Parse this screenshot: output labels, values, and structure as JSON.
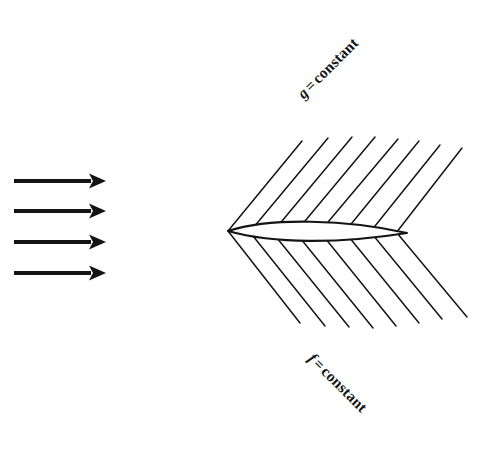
{
  "figure": {
    "type": "flow-field-diagram",
    "background_color": "#ffffff",
    "ink_color": "#141414",
    "width": 489,
    "height": 450
  },
  "labels": {
    "upper": {
      "variable": "g",
      "equals": "=",
      "value": "constant",
      "full_text": "g = constant",
      "rotation_deg": -45,
      "x": 300,
      "y": 88
    },
    "lower": {
      "variable": "f",
      "equals": "=",
      "value": "constant",
      "full_text": "f = constant",
      "rotation_deg": 45,
      "x": 311,
      "y": 348
    }
  },
  "freestream_arrows": {
    "name": "uniform-flow-arrows",
    "count": 4,
    "direction": "right",
    "color": "#141414",
    "shaft_thickness": 4.2,
    "head_length": 17,
    "head_half_width": 7.5,
    "x_start": 14,
    "x_end": 106,
    "y_positions": [
      181,
      211,
      242,
      273
    ]
  },
  "airfoil": {
    "name": "lens-airfoil",
    "leading_edge": {
      "x": 228,
      "y": 231
    },
    "trailing_edge": {
      "x": 407,
      "y": 233
    },
    "max_thickness": 15,
    "stroke_width": 2.1,
    "fill": "#ffffff"
  },
  "streamlines_upper": {
    "name": "g-constant-lines",
    "count": 8,
    "angle_deg": -45,
    "stroke_width": 1.5,
    "lines": [
      {
        "x1": 228,
        "y1": 231,
        "x2": 302,
        "y2": 141
      },
      {
        "x1": 253,
        "y1": 228,
        "x2": 328,
        "y2": 138
      },
      {
        "x1": 277,
        "y1": 227,
        "x2": 352,
        "y2": 137
      },
      {
        "x1": 300,
        "y1": 227,
        "x2": 375,
        "y2": 137
      },
      {
        "x1": 323,
        "y1": 228,
        "x2": 398,
        "y2": 139
      },
      {
        "x1": 347,
        "y1": 229,
        "x2": 419,
        "y2": 141
      },
      {
        "x1": 371,
        "y1": 231,
        "x2": 440,
        "y2": 145
      },
      {
        "x1": 396,
        "y1": 233,
        "x2": 462,
        "y2": 148
      }
    ]
  },
  "streamlines_lower": {
    "name": "f-constant-lines",
    "count": 8,
    "angle_deg": 45,
    "stroke_width": 1.5,
    "lines": [
      {
        "x1": 228,
        "y1": 231,
        "x2": 300,
        "y2": 323
      },
      {
        "x1": 253,
        "y1": 236,
        "x2": 325,
        "y2": 326
      },
      {
        "x1": 277,
        "y1": 238,
        "x2": 349,
        "y2": 327
      },
      {
        "x1": 301,
        "y1": 239,
        "x2": 373,
        "y2": 328
      },
      {
        "x1": 325,
        "y1": 238,
        "x2": 396,
        "y2": 326
      },
      {
        "x1": 349,
        "y1": 237,
        "x2": 419,
        "y2": 323
      },
      {
        "x1": 373,
        "y1": 235,
        "x2": 442,
        "y2": 319
      },
      {
        "x1": 397,
        "y1": 233,
        "x2": 467,
        "y2": 317
      }
    ]
  }
}
